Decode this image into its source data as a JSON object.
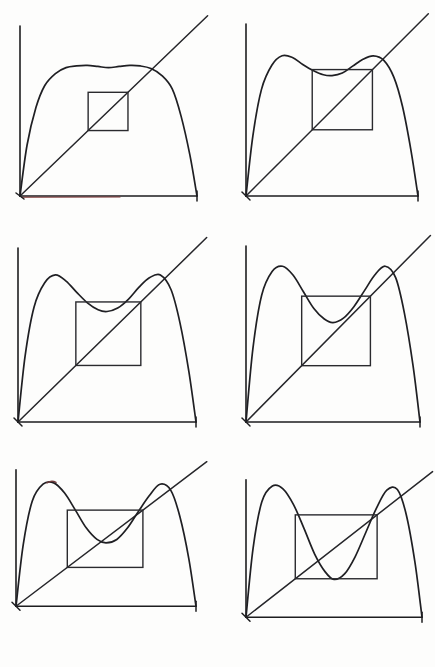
{
  "figure": {
    "kind": "hand-drawn mathematical figure",
    "grid": {
      "columns": 2,
      "rows": 3,
      "panel_count": 6
    },
    "background_color": "#fdfdfc",
    "curve_color": "#1f1f23",
    "axis_color": "#1d1d1f",
    "diagonal_color": "#26262a",
    "box_color": "#2a2a2e",
    "accent_color": "#7d3535"
  },
  "chart_data": [
    {
      "type": "line",
      "title": "Panel 1",
      "xlabel": "",
      "ylabel": "",
      "xlim": [
        0,
        1
      ],
      "ylim": [
        0,
        1
      ],
      "grid": false,
      "legend": "none",
      "annotations": [
        "flat broad hump",
        "shallow central dip",
        "small inset box"
      ],
      "series": [
        {
          "name": "second-iterate-curve",
          "x": [
            0.0,
            0.04,
            0.09,
            0.14,
            0.2,
            0.26,
            0.32,
            0.38,
            0.44,
            0.5,
            0.56,
            0.62,
            0.68,
            0.74,
            0.8,
            0.86,
            0.91,
            0.96,
            1.0
          ],
          "values": [
            0.0,
            0.3,
            0.52,
            0.65,
            0.72,
            0.755,
            0.765,
            0.768,
            0.762,
            0.755,
            0.762,
            0.768,
            0.765,
            0.75,
            0.71,
            0.63,
            0.47,
            0.24,
            0.0
          ]
        },
        {
          "name": "identity-diagonal",
          "x": [
            0.0,
            1.06
          ],
          "values": [
            0.0,
            1.06
          ]
        }
      ],
      "box": {
        "x0": 0.385,
        "x1": 0.61,
        "y0": 0.385,
        "y1": 0.61
      },
      "fixed_points": [
        0.0,
        0.613
      ]
    },
    {
      "type": "line",
      "title": "Panel 2",
      "xlabel": "",
      "ylabel": "",
      "xlim": [
        0,
        1
      ],
      "ylim": [
        0,
        1
      ],
      "grid": false,
      "legend": "none",
      "annotations": [
        "two humps emerging",
        "dip below diagonal",
        "box touches humps"
      ],
      "series": [
        {
          "name": "second-iterate-curve",
          "x": [
            0.0,
            0.04,
            0.09,
            0.15,
            0.21,
            0.27,
            0.33,
            0.39,
            0.45,
            0.5,
            0.56,
            0.62,
            0.68,
            0.74,
            0.8,
            0.86,
            0.91,
            0.96,
            1.0
          ],
          "values": [
            0.0,
            0.35,
            0.62,
            0.76,
            0.815,
            0.805,
            0.765,
            0.73,
            0.705,
            0.7,
            0.715,
            0.755,
            0.795,
            0.815,
            0.79,
            0.69,
            0.52,
            0.26,
            0.0
          ]
        },
        {
          "name": "identity-diagonal",
          "x": [
            0.0,
            1.06
          ],
          "values": [
            0.0,
            1.06
          ]
        }
      ],
      "box": {
        "x0": 0.385,
        "x1": 0.735,
        "y0": 0.385,
        "y1": 0.735
      },
      "fixed_points": [
        0.0,
        0.735
      ]
    },
    {
      "type": "line",
      "title": "Panel 3",
      "xlabel": "",
      "ylabel": "",
      "xlim": [
        0,
        1
      ],
      "ylim": [
        0,
        1
      ],
      "grid": false,
      "legend": "none",
      "annotations": [
        "humps more pronounced",
        "curve nearly tangent to diagonal",
        "box enlarged"
      ],
      "series": [
        {
          "name": "second-iterate-curve",
          "x": [
            0.0,
            0.04,
            0.09,
            0.15,
            0.21,
            0.27,
            0.33,
            0.39,
            0.45,
            0.5,
            0.56,
            0.62,
            0.68,
            0.74,
            0.8,
            0.86,
            0.91,
            0.96,
            1.0
          ],
          "values": [
            0.0,
            0.38,
            0.66,
            0.8,
            0.845,
            0.81,
            0.745,
            0.685,
            0.645,
            0.635,
            0.655,
            0.705,
            0.775,
            0.83,
            0.845,
            0.76,
            0.57,
            0.29,
            0.0
          ]
        },
        {
          "name": "identity-diagonal",
          "x": [
            0.0,
            1.06
          ],
          "values": [
            0.0,
            1.06
          ]
        }
      ],
      "box": {
        "x0": 0.325,
        "x1": 0.69,
        "y0": 0.325,
        "y1": 0.69
      },
      "fixed_points": [
        0.0,
        0.69
      ]
    },
    {
      "type": "line",
      "title": "Panel 4",
      "xlabel": "",
      "ylabel": "",
      "xlim": [
        0,
        1
      ],
      "ylim": [
        0,
        1
      ],
      "grid": false,
      "legend": "none",
      "annotations": [
        "dip crosses diagonal twice",
        "period-2 points born",
        "box larger still"
      ],
      "series": [
        {
          "name": "second-iterate-curve",
          "x": [
            0.0,
            0.04,
            0.09,
            0.15,
            0.21,
            0.27,
            0.33,
            0.39,
            0.45,
            0.5,
            0.56,
            0.62,
            0.68,
            0.74,
            0.8,
            0.86,
            0.91,
            0.96,
            1.0
          ],
          "values": [
            0.0,
            0.42,
            0.72,
            0.855,
            0.885,
            0.835,
            0.74,
            0.645,
            0.585,
            0.565,
            0.59,
            0.655,
            0.745,
            0.835,
            0.885,
            0.82,
            0.62,
            0.32,
            0.0
          ]
        },
        {
          "name": "identity-diagonal",
          "x": [
            0.0,
            1.06
          ],
          "values": [
            0.0,
            1.06
          ]
        }
      ],
      "box": {
        "x0": 0.32,
        "x1": 0.715,
        "y0": 0.32,
        "y1": 0.715
      },
      "fixed_points": [
        0.0,
        0.715
      ]
    },
    {
      "type": "line",
      "title": "Panel 5",
      "xlabel": "",
      "ylabel": "",
      "xlim": [
        0,
        1
      ],
      "ylim": [
        0,
        1
      ],
      "grid": false,
      "legend": "none",
      "annotations": [
        "deep central valley",
        "clear period-2 crossings",
        "wide inset box"
      ],
      "series": [
        {
          "name": "second-iterate-curve",
          "x": [
            0.0,
            0.04,
            0.09,
            0.15,
            0.21,
            0.27,
            0.33,
            0.39,
            0.45,
            0.5,
            0.56,
            0.62,
            0.68,
            0.74,
            0.8,
            0.86,
            0.91,
            0.96,
            1.0
          ],
          "values": [
            0.0,
            0.45,
            0.77,
            0.895,
            0.905,
            0.83,
            0.705,
            0.575,
            0.49,
            0.465,
            0.49,
            0.575,
            0.695,
            0.81,
            0.895,
            0.85,
            0.66,
            0.35,
            0.0
          ]
        },
        {
          "name": "identity-diagonal",
          "x": [
            0.0,
            1.06
          ],
          "values": [
            0.0,
            1.06
          ]
        }
      ],
      "box": {
        "x0": 0.285,
        "x1": 0.705,
        "y0": 0.285,
        "y1": 0.705
      },
      "fixed_points": [
        0.0,
        0.705
      ]
    },
    {
      "type": "line",
      "title": "Panel 6",
      "xlabel": "",
      "ylabel": "",
      "xlim": [
        0,
        1
      ],
      "ylim": [
        0,
        1
      ],
      "grid": false,
      "legend": "none",
      "annotations": [
        "valley drops below box",
        "steep tall humps",
        "widest inset box"
      ],
      "series": [
        {
          "name": "second-iterate-curve",
          "x": [
            0.0,
            0.04,
            0.09,
            0.15,
            0.21,
            0.27,
            0.33,
            0.39,
            0.45,
            0.5,
            0.56,
            0.62,
            0.68,
            0.74,
            0.8,
            0.86,
            0.91,
            0.96,
            1.0
          ],
          "values": [
            0.0,
            0.5,
            0.84,
            0.955,
            0.935,
            0.82,
            0.645,
            0.46,
            0.33,
            0.275,
            0.315,
            0.44,
            0.615,
            0.79,
            0.925,
            0.93,
            0.75,
            0.4,
            0.0
          ]
        },
        {
          "name": "identity-diagonal",
          "x": [
            0.0,
            1.06
          ],
          "values": [
            0.0,
            1.06
          ]
        }
      ],
      "box": {
        "x0": 0.28,
        "x1": 0.745,
        "y0": 0.28,
        "y1": 0.745
      },
      "fixed_points": [
        0.0,
        0.745
      ]
    }
  ]
}
